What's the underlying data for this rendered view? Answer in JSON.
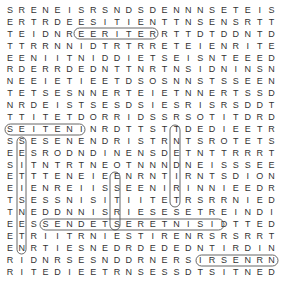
{
  "puzzle": {
    "rows": [
      "SRENEISRSNDSDENNNSETEIS",
      "ERTRDEESITIENTTNSENSRTT",
      "TEIDNREERITERRTTDTDDNTD",
      "TTRRNNIDTRTRRETEIENRITE",
      "EENIITNIDDIETSEISNTEEED",
      "RDERRDEDNTTNRTNSIDNINSN",
      "NEEIETIEETDSOSNNSTSSEEN",
      "TETSESNNERTEIETNNERTSSD",
      "NRDEISTSESDSIESRISRSDDT",
      "TTITETDORRIDSSRSOTITDRD",
      "SEITENINRDTTSTTDEDIEETR",
      "SSESENENDRISTRNTSROTETS",
      "EESRODNDINENSDETNTTRRRT",
      "SITNTRTNEOTNNNDNEISSSEE",
      "ETTTENEIEENRNTIRNTSDION",
      "EIENREIISSEENIRINNIEEDR",
      "TSESSNISITIITETRSRRNIED",
      "TNEDDNNISRIESESETREINDI",
      "EESSENDETSERETNISIDTTED",
      "ETRIITRNIESTIRENRSRSRRT",
      "ENRTIESNEDRDEDEDNTIRDIN",
      "RIDNRSESNDDRNERSIRSENRN",
      "RITEDIEETRNSESSDTSITNED"
    ],
    "found_words": [
      "SEITEN",
      "SSENDETSERETNISID",
      "TSITNED",
      "REERITER",
      "TNEDIRTS"
    ]
  }
}
